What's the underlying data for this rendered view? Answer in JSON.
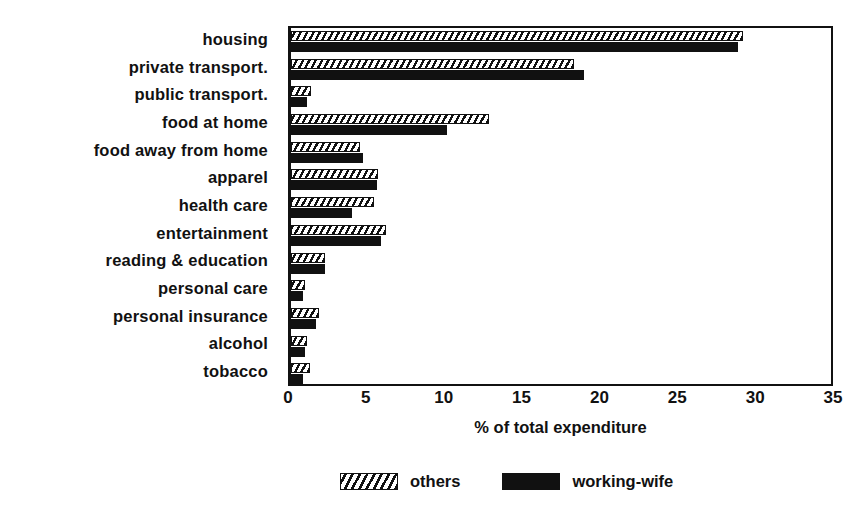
{
  "chart_data": {
    "type": "bar",
    "orientation": "horizontal",
    "title": "",
    "xlabel": "% of total expenditure",
    "ylabel": "",
    "xlim": [
      0,
      35
    ],
    "xticks": [
      0,
      5,
      10,
      15,
      20,
      25,
      30,
      35
    ],
    "grid": false,
    "legend_position": "bottom",
    "categories": [
      "housing",
      "private transport.",
      "public transport.",
      "food at home",
      "food away from home",
      "apparel",
      "health care",
      "entertainment",
      "reading & education",
      "personal care",
      "personal insurance",
      "alcohol",
      "tobacco"
    ],
    "series": [
      {
        "name": "others",
        "fill": "hatched",
        "values": [
          29.0,
          18.2,
          1.3,
          12.7,
          4.4,
          5.6,
          5.3,
          6.1,
          2.2,
          0.9,
          1.8,
          1.0,
          1.2
        ]
      },
      {
        "name": "working-wife",
        "fill": "solid-black",
        "values": [
          28.7,
          18.8,
          1.0,
          10.0,
          4.6,
          5.5,
          3.9,
          5.8,
          2.2,
          0.8,
          1.6,
          0.9,
          0.8
        ]
      }
    ]
  },
  "legend": {
    "items": [
      {
        "label": "others",
        "swatch": "hatched-swatch"
      },
      {
        "label": "working-wife",
        "swatch": "solid-black-swatch"
      }
    ]
  },
  "colors": {
    "ink": "#111111",
    "paper": "#ffffff"
  }
}
